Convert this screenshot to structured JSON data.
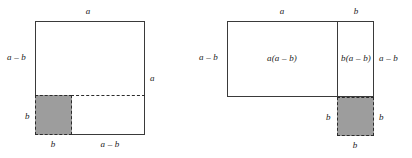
{
  "figure": {
    "type": "geometric-diagram",
    "background_color": "#ffffff",
    "outline_color": "#3a3a3a",
    "shade_color": "#9d9d9d",
    "dash_color": "#2b2b2b",
    "left_panel": {
      "name": "square-with-corner-removed",
      "labels": {
        "top": "a",
        "left_upper": "a – b",
        "right": "a",
        "left_lower": "b",
        "bottom_shaded": "b",
        "bottom_right": "a – b"
      }
    },
    "right_panel": {
      "name": "rearranged-rectangles",
      "labels": {
        "top_left": "a",
        "top_right": "b",
        "left": "a – b",
        "area_left": "a(a – b)",
        "area_right": "b(a – b)",
        "right": "a – b",
        "shaded_left": "b",
        "shaded_right": "b",
        "shaded_bottom": "b"
      }
    }
  }
}
